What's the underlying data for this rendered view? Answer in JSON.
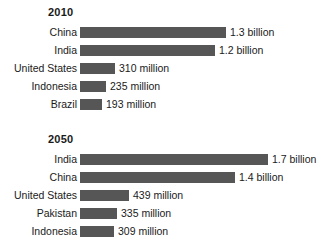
{
  "chart_data": {
    "type": "bar",
    "orientation": "horizontal",
    "title": "",
    "subtitle": "",
    "xlabel": "",
    "ylabel": "",
    "grid": false,
    "legend": "none",
    "axis_visible": false,
    "units": "people",
    "xlim": [
      0,
      1700000000
    ],
    "bar_color": "#565656",
    "text_color": "#1a1a1a",
    "background_color": "#ffffff",
    "groups": [
      {
        "title": "2010",
        "categories": [
          "China",
          "India",
          "United States",
          "Indonesia",
          "Brazil"
        ],
        "values": [
          1300000000,
          1200000000,
          310000000,
          235000000,
          193000000
        ],
        "value_labels": [
          "1.3 billion",
          "1.2 billion",
          "310 million",
          "235 million",
          "193 million"
        ],
        "bars": [
          {
            "label": "China",
            "value_label": "1.3 billion",
            "value": 1300000000,
            "pct": 100
          },
          {
            "label": "India",
            "value_label": "1.2 billion",
            "value": 1200000000,
            "pct": 92.3
          },
          {
            "label": "United States",
            "value_label": "310 million",
            "value": 310000000,
            "pct": 23.8
          },
          {
            "label": "Indonesia",
            "value_label": "235 million",
            "value": 235000000,
            "pct": 18.1
          },
          {
            "label": "Brazil",
            "value_label": "193 million",
            "value": 193000000,
            "pct": 14.8
          }
        ]
      },
      {
        "title": "2050",
        "categories": [
          "India",
          "China",
          "United States",
          "Pakistan",
          "Indonesia"
        ],
        "values": [
          1700000000,
          1400000000,
          439000000,
          335000000,
          309000000
        ],
        "value_labels": [
          "1.7 billion",
          "1.4 billion",
          "439 million",
          "335 million",
          "309 million"
        ],
        "bars": [
          {
            "label": "India",
            "value_label": "1.7 billion",
            "value": 1700000000,
            "pct": 100
          },
          {
            "label": "China",
            "value_label": "1.4 billion",
            "value": 1400000000,
            "pct": 82.4
          },
          {
            "label": "United States",
            "value_label": "439 million",
            "value": 439000000,
            "pct": 25.8
          },
          {
            "label": "Pakistan",
            "value_label": "335 million",
            "value": 335000000,
            "pct": 19.7
          },
          {
            "label": "Indonesia",
            "value_label": "309 million",
            "value": 309000000,
            "pct": 18.2
          }
        ]
      }
    ]
  }
}
